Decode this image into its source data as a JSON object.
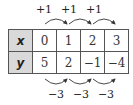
{
  "table": {
    "rows": [
      {
        "header": "x",
        "values": [
          "0",
          "1",
          "2",
          "3"
        ]
      },
      {
        "header": "y",
        "values": [
          "5",
          "2",
          "−1",
          "−4"
        ]
      }
    ]
  },
  "annotations": {
    "top": [
      "+1",
      "+1",
      "+1"
    ],
    "bottom": [
      "−3",
      "−3",
      "−3"
    ]
  },
  "colors": {
    "header_background": "#d9d9d9",
    "border": "#555555",
    "text": "#222222"
  }
}
